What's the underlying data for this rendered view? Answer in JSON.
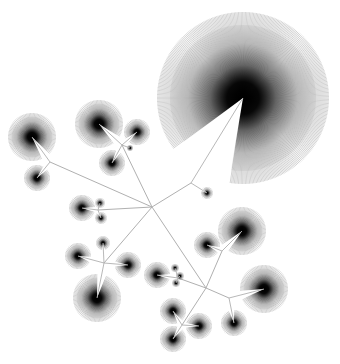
{
  "diagram": {
    "type": "radial-tree-fan-layout",
    "width": 340,
    "height": 364,
    "background": "#ffffff",
    "edge_color": "#b0b0b0",
    "spoke_color": "#000000",
    "hubs": [
      {
        "id": "root",
        "x": 152,
        "y": 207
      },
      {
        "id": "h-top",
        "x": 191,
        "y": 183
      },
      {
        "id": "h-ab",
        "x": 50,
        "y": 162
      },
      {
        "id": "h-cde",
        "x": 122,
        "y": 145
      },
      {
        "id": "h-ghi",
        "x": 98,
        "y": 210
      },
      {
        "id": "h-jklm",
        "x": 104,
        "y": 263
      },
      {
        "id": "h-lower",
        "x": 206,
        "y": 288
      },
      {
        "id": "h-wx",
        "x": 222,
        "y": 251
      },
      {
        "id": "h-nopq",
        "x": 178,
        "y": 278
      },
      {
        "id": "h-uv",
        "x": 229,
        "y": 298
      },
      {
        "id": "h-rst",
        "x": 182,
        "y": 325
      }
    ],
    "nodes": [
      {
        "id": "Z",
        "x": 243,
        "y": 98,
        "r": 86,
        "hub": "h-top",
        "gap_deg": 210,
        "gap_width": 22
      },
      {
        "id": "Y",
        "x": 207,
        "y": 193,
        "r": 6,
        "hub": "h-top"
      },
      {
        "id": "A",
        "x": 32,
        "y": 137,
        "r": 24,
        "hub": "h-ab"
      },
      {
        "id": "B",
        "x": 37,
        "y": 178,
        "r": 13,
        "hub": "h-ab"
      },
      {
        "id": "C",
        "x": 99,
        "y": 124,
        "r": 24,
        "hub": "h-cde"
      },
      {
        "id": "D",
        "x": 137,
        "y": 132,
        "r": 13,
        "hub": "h-cde"
      },
      {
        "id": "E",
        "x": 112,
        "y": 163,
        "r": 13,
        "hub": "h-cde"
      },
      {
        "id": "F",
        "x": 130,
        "y": 148,
        "r": 3,
        "hub": "h-cde"
      },
      {
        "id": "G",
        "x": 82,
        "y": 208,
        "r": 13,
        "hub": "h-ghi"
      },
      {
        "id": "H",
        "x": 100,
        "y": 203,
        "r": 5,
        "hub": "h-ghi"
      },
      {
        "id": "I",
        "x": 101,
        "y": 218,
        "r": 6,
        "hub": "h-ghi"
      },
      {
        "id": "J",
        "x": 103,
        "y": 243,
        "r": 7,
        "hub": "h-jklm"
      },
      {
        "id": "K",
        "x": 78,
        "y": 256,
        "r": 13,
        "hub": "h-jklm"
      },
      {
        "id": "L",
        "x": 128,
        "y": 265,
        "r": 13,
        "hub": "h-jklm"
      },
      {
        "id": "M",
        "x": 97,
        "y": 298,
        "r": 24,
        "hub": "h-jklm"
      },
      {
        "id": "W",
        "x": 242,
        "y": 231,
        "r": 24,
        "hub": "h-wx"
      },
      {
        "id": "X",
        "x": 207,
        "y": 245,
        "r": 13,
        "hub": "h-wx"
      },
      {
        "id": "N",
        "x": 157,
        "y": 275,
        "r": 13,
        "hub": "h-nopq"
      },
      {
        "id": "O",
        "x": 175,
        "y": 268,
        "r": 4,
        "hub": "h-nopq"
      },
      {
        "id": "P",
        "x": 180,
        "y": 276,
        "r": 4,
        "hub": "h-nopq"
      },
      {
        "id": "Q",
        "x": 176,
        "y": 283,
        "r": 4,
        "hub": "h-nopq"
      },
      {
        "id": "V",
        "x": 264,
        "y": 289,
        "r": 24,
        "hub": "h-uv"
      },
      {
        "id": "U",
        "x": 234,
        "y": 323,
        "r": 13,
        "hub": "h-uv"
      },
      {
        "id": "R",
        "x": 173,
        "y": 311,
        "r": 13,
        "hub": "h-rst"
      },
      {
        "id": "S",
        "x": 199,
        "y": 326,
        "r": 13,
        "hub": "h-rst"
      },
      {
        "id": "T",
        "x": 173,
        "y": 339,
        "r": 13,
        "hub": "h-rst"
      }
    ],
    "edges": [
      [
        "root",
        "h-top"
      ],
      [
        "root",
        "h-ab"
      ],
      [
        "root",
        "h-cde"
      ],
      [
        "root",
        "h-ghi"
      ],
      [
        "root",
        "h-jklm"
      ],
      [
        "root",
        "h-lower"
      ],
      [
        "h-lower",
        "h-wx"
      ],
      [
        "h-lower",
        "h-nopq"
      ],
      [
        "h-lower",
        "h-uv"
      ],
      [
        "h-lower",
        "h-rst"
      ]
    ]
  }
}
